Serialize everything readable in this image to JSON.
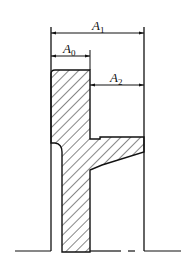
{
  "diagram": {
    "type": "mechanical cross-section with dimension chain",
    "dimensions": [
      {
        "id": "A1",
        "symbol": "A",
        "subscript": "1"
      },
      {
        "id": "A0",
        "symbol": "A",
        "subscript": "0"
      },
      {
        "id": "A2",
        "symbol": "A",
        "subscript": "2"
      }
    ],
    "colors": {
      "line": "#111111",
      "background": "#ffffff"
    }
  }
}
